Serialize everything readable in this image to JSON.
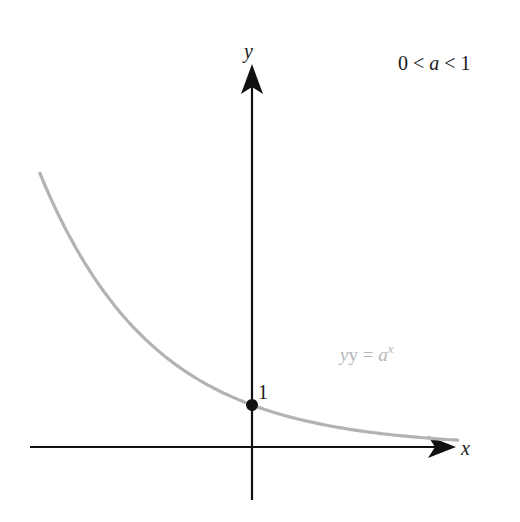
{
  "figure": {
    "condition_label": {
      "parts": [
        "0 < ",
        "a",
        " < 1"
      ]
    },
    "axes": {
      "x_label": "x",
      "y_label": "y"
    },
    "curve": {
      "equation_prefix": "y = ",
      "equation_base": "a",
      "equation_exponent": "x",
      "base_value": 0.69,
      "x_range": [
        -5.05,
        4.9
      ]
    },
    "intercept_point": {
      "x": 0,
      "y": 1,
      "label": "1"
    },
    "colors": {
      "axis": "#111111",
      "curve": "#b3b3b3",
      "equation_text": "#b8b8b8",
      "point": "#111111",
      "text": "#1a1a1a"
    }
  },
  "chart_data": {
    "type": "line",
    "title": "0 < a < 1",
    "xlabel": "x",
    "ylabel": "y",
    "series": [
      {
        "name": "y = a^x",
        "function": "a^x",
        "a": 0.69,
        "x": [
          -5,
          -4,
          -3,
          -2,
          -1,
          0,
          1,
          2,
          3,
          4,
          4.9
        ],
        "values": [
          6.38,
          4.4,
          3.04,
          2.1,
          1.45,
          1.0,
          0.69,
          0.48,
          0.33,
          0.23,
          0.16
        ]
      }
    ],
    "annotations": [
      {
        "text": "1",
        "at": [
          0,
          1
        ]
      },
      {
        "text": "y = a^x",
        "near": "curve, lower-right"
      },
      {
        "text": "0 < a < 1",
        "placement": "top-right"
      }
    ],
    "xlim": [
      -5.3,
      4.9
    ],
    "ylim": [
      -1.3,
      9.0
    ],
    "grid": false,
    "legend": "none"
  }
}
